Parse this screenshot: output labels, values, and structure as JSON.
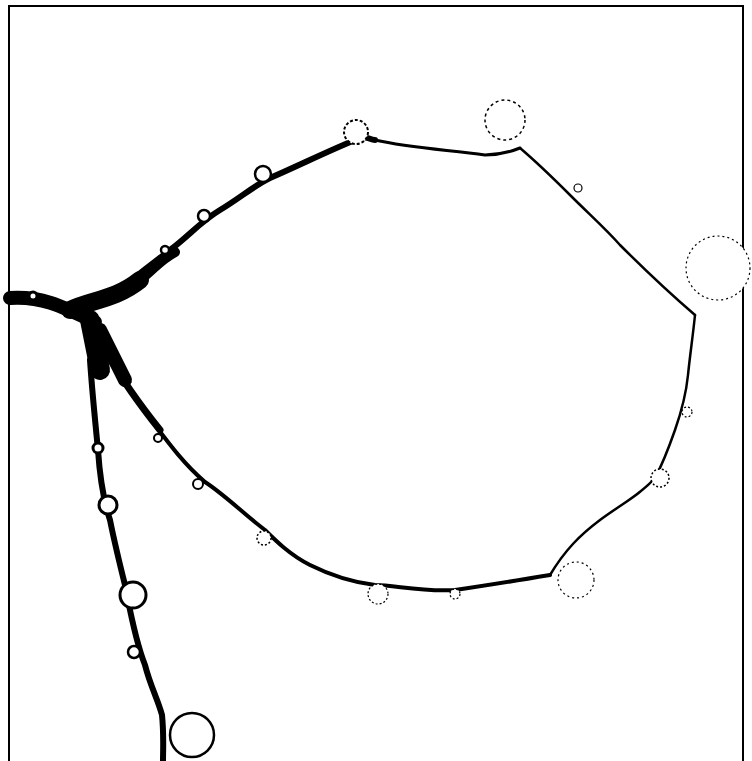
{
  "figure": {
    "colors": {
      "background": "#ffffff",
      "ink": "#000000"
    }
  }
}
